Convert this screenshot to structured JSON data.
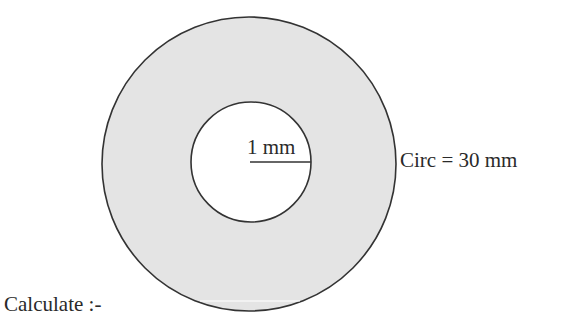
{
  "diagram": {
    "type": "annulus",
    "outer_circle": {
      "center": [
        249,
        164
      ],
      "radius": 147,
      "fill": "#e4e4e4",
      "stroke": "#333333"
    },
    "inner_circle": {
      "center": [
        251,
        162
      ],
      "radius": 60,
      "fill": "#ffffff",
      "stroke": "#333333"
    },
    "radius_line": {
      "from": [
        250,
        162
      ],
      "to": [
        311,
        162
      ]
    },
    "labels": {
      "inner_radius": "1 mm",
      "outer_circumference": "Circ = 30 mm",
      "prompt": "Calculate :-"
    }
  }
}
